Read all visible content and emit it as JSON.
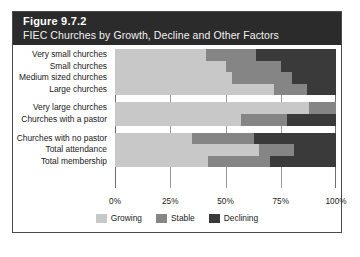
{
  "figure": {
    "number": "Figure 9.7.2",
    "subtitle": "FIEC Churches by Growth, Decline and Other Factors"
  },
  "colors": {
    "header_background": "#2b2b2b",
    "header_text": "#ffffff",
    "growing": "#c8c8c8",
    "stable": "#858585",
    "declining": "#3a3a3a",
    "frame_border": "#4a4a4a"
  },
  "chart_data": {
    "type": "bar",
    "orientation": "horizontal",
    "stacked": true,
    "normalized": "100%",
    "title": "Figure 9.7.2",
    "subtitle": "FIEC Churches by Growth, Decline and Other Factors",
    "xlabel": "",
    "ylabel": "",
    "xlim": [
      0,
      100
    ],
    "xticks": [
      0,
      25,
      50,
      75,
      100
    ],
    "xticklabels": [
      "0%",
      "25%",
      "50%",
      "75%",
      "100%"
    ],
    "grid": true,
    "legend_position": "bottom",
    "categories": [
      "Very small churches",
      "Small churches",
      "Medium sized churches",
      "Large churches",
      "Very large churches",
      "Churches with a pastor",
      "Churches with no pastor",
      "Total attendance",
      "Total membership"
    ],
    "group_breaks_after": [
      4,
      6
    ],
    "series": [
      {
        "name": "Growing",
        "color": "#c8c8c8",
        "values": [
          41,
          50,
          53,
          72,
          88,
          57,
          35,
          65,
          42
        ]
      },
      {
        "name": "Stable",
        "color": "#858585",
        "values": [
          23,
          25,
          27,
          15,
          12,
          21,
          28,
          16,
          28
        ]
      },
      {
        "name": "Declining",
        "color": "#3a3a3a",
        "values": [
          36,
          25,
          20,
          13,
          0,
          22,
          37,
          19,
          30
        ]
      }
    ],
    "legend": [
      "Growing",
      "Stable",
      "Declining"
    ]
  }
}
